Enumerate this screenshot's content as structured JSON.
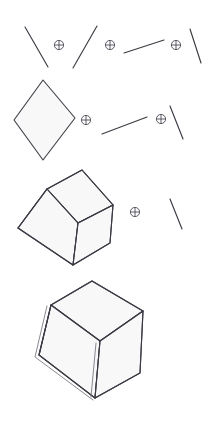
{
  "header": {
    "number": "4",
    "title": "Geometric and Solid Foundations"
  },
  "figure": {
    "caption": "Spatial composition sequence: line segments and polygons combined with the direct-sum operator to build solids",
    "operator_symbol": "circled-plus",
    "operator_name": "direct-sum",
    "stroke_color": "#3b3b44",
    "face_fill_color": "#f8f8f9",
    "background_color": "#ffffff",
    "rows": [
      {
        "id": "row-1",
        "label": "Row 1: four line segments joined by three operators",
        "items": [
          {
            "kind": "segment",
            "name": "segment-a",
            "x1": 25,
            "y1": 27,
            "x2": 48,
            "y2": 67
          },
          {
            "kind": "operator",
            "name": "operator-1",
            "cx": 59,
            "cy": 45,
            "r": 5
          },
          {
            "kind": "segment",
            "name": "segment-b",
            "x1": 97,
            "y1": 26,
            "x2": 73,
            "y2": 68
          },
          {
            "kind": "operator",
            "name": "operator-2",
            "cx": 110,
            "cy": 45,
            "r": 5
          },
          {
            "kind": "segment",
            "name": "segment-c",
            "x1": 124,
            "y1": 53,
            "x2": 164,
            "y2": 40
          },
          {
            "kind": "operator",
            "name": "operator-3",
            "cx": 176,
            "cy": 45,
            "r": 5
          },
          {
            "kind": "segment",
            "name": "segment-d",
            "x1": 190,
            "y1": 29,
            "x2": 201,
            "y2": 63
          }
        ]
      },
      {
        "id": "row-2",
        "label": "Row 2: rhombus combined with two line segments",
        "items": [
          {
            "kind": "rhombus",
            "name": "rhombus-shape",
            "points": "43,80 75,118 43,160 14,120"
          },
          {
            "kind": "operator",
            "name": "operator-4",
            "cx": 86,
            "cy": 120,
            "r": 5
          },
          {
            "kind": "segment",
            "name": "segment-e",
            "x1": 102,
            "y1": 134,
            "x2": 147,
            "y2": 117
          },
          {
            "kind": "operator",
            "name": "operator-5",
            "cx": 161,
            "cy": 119,
            "r": 5
          },
          {
            "kind": "segment",
            "name": "segment-f",
            "x1": 170,
            "y1": 106,
            "x2": 183,
            "y2": 139
          }
        ]
      },
      {
        "id": "row-3",
        "label": "Row 3: isometric cube combined with one line segment",
        "items": [
          {
            "kind": "cube",
            "name": "cube-small"
          },
          {
            "kind": "operator",
            "name": "operator-6",
            "cx": 135,
            "cy": 212,
            "r": 5
          },
          {
            "kind": "segment",
            "name": "segment-g",
            "x1": 170,
            "y1": 199,
            "x2": 182,
            "y2": 229
          }
        ]
      },
      {
        "id": "row-4",
        "label": "Row 4: completed large hexahedron solid",
        "items": [
          {
            "kind": "cube",
            "name": "cube-large"
          }
        ]
      }
    ]
  }
}
